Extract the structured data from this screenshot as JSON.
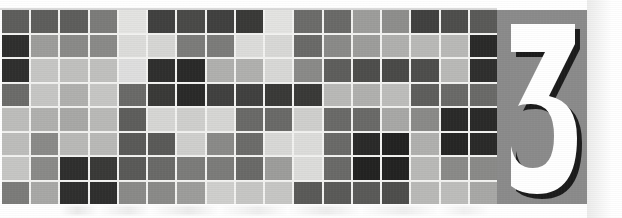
{
  "banner": {
    "title": "chapter-opener-banner",
    "width": 622,
    "height": 218,
    "background_color": "#ffffff"
  },
  "numeral": {
    "value": "3",
    "label": "Chapter 3",
    "glyph_color": "#ffffff",
    "panel_color": "#8b8b8b",
    "shadow_color": "#1c1c1c"
  },
  "mosaic": {
    "rows": 8,
    "columns": 17,
    "gridline_color": "#f2f2f0",
    "palette": {
      "lightest": "#e3e3e1",
      "light": "#cfcfcd",
      "mid_light": "#b9b9b7",
      "mid": "#9d9d9b",
      "mid_dark": "#7c7c7a",
      "dark": "#5e5e5c",
      "darker": "#414140",
      "darkest": "#2a2a29"
    },
    "cells": [
      [
        "#5e5e5c",
        "#5e5e5c",
        "#5e5e5c",
        "#7c7c7a",
        "#e3e3e1",
        "#414140",
        "#4a4a48",
        "#414140",
        "#3a3a38",
        "#e3e3e1",
        "#6c6c6a",
        "#6a6a68",
        "#9d9d9b",
        "#8e8e8c",
        "#414140",
        "#4e4e4c",
        "#5a5a58"
      ],
      [
        "#2f2f2e",
        "#9d9d9b",
        "#8a8a88",
        "#8a8a88",
        "#dcdcda",
        "#d6d6d4",
        "#7c7c7a",
        "#7c7c7a",
        "#dcdcda",
        "#d8d8d6",
        "#6a6a68",
        "#8a8a88",
        "#9d9d9b",
        "#b0b0ae",
        "#b9b9b7",
        "#b9b9b7",
        "#2a2a29"
      ],
      [
        "#2f2f2e",
        "#c6c6c4",
        "#c0c0be",
        "#c0c0be",
        "#dedede",
        "#2f2f2e",
        "#2a2a29",
        "#b0b0ae",
        "#b0b0ae",
        "#d8d8d6",
        "#8a8a88",
        "#5e5e5c",
        "#4e4e4c",
        "#4a4a48",
        "#4e4e4c",
        "#b9b9b7",
        "#2f2f2e"
      ],
      [
        "#6c6c6a",
        "#c6c6c4",
        "#b0b0ae",
        "#c6c6c4",
        "#6a6a68",
        "#3a3a38",
        "#2a2a29",
        "#414140",
        "#414140",
        "#3a3a38",
        "#3a3a38",
        "#b9b9b7",
        "#b0b0ae",
        "#bdbdbb",
        "#5e5e5c",
        "#6a6a68",
        "#6a6a68"
      ],
      [
        "#bdbdbb",
        "#b0b0ae",
        "#a8a8a6",
        "#b9b9b7",
        "#5e5e5c",
        "#d6d6d4",
        "#cfcfcd",
        "#d6d6d4",
        "#6a6a68",
        "#6a6a68",
        "#cfcfcd",
        "#6a6a68",
        "#6a6a68",
        "#a8a8a6",
        "#8a8a88",
        "#2a2a29",
        "#2a2a29"
      ],
      [
        "#bdbdbb",
        "#8a8a88",
        "#b9b9b7",
        "#b9b9b7",
        "#5a5a58",
        "#5a5a58",
        "#cfcfcd",
        "#8a8a88",
        "#6c6c6a",
        "#d8d8d6",
        "#dcdcda",
        "#6a6a68",
        "#2a2a29",
        "#232322",
        "#b0b0ae",
        "#262625",
        "#2a2a29"
      ],
      [
        "#c6c6c4",
        "#8a8a88",
        "#2f2f2e",
        "#3a3a38",
        "#5a5a58",
        "#6a6a68",
        "#7c7c7a",
        "#7c7c7a",
        "#6a6a68",
        "#9d9d9b",
        "#dcdcda",
        "#6a6a68",
        "#232322",
        "#232322",
        "#b9b9b7",
        "#8a8a88",
        "#8a8a88"
      ],
      [
        "#7c7c7a",
        "#a8a8a6",
        "#2f2f2e",
        "#2f2f2e",
        "#8a8a88",
        "#8a8a88",
        "#9d9d9b",
        "#cfcfcd",
        "#c6c6c4",
        "#c6c6c4",
        "#5a5a58",
        "#5a5a58",
        "#5a5a58",
        "#4e4e4c",
        "#b9b9b7",
        "#bdbdbb",
        "#a8a8a6"
      ]
    ],
    "cells_extra_row8": [
      "#a8a8a6",
      "#c0c0be",
      "#2a2a29",
      "#2a2a29",
      "#b9b9b7"
    ]
  }
}
